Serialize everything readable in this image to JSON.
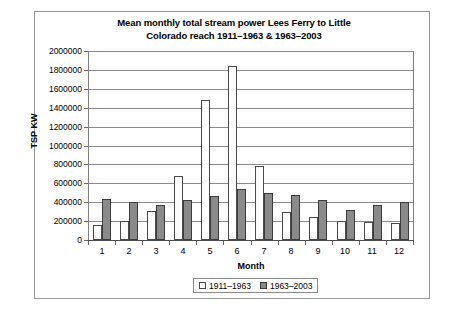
{
  "chart_data": {
    "type": "bar",
    "title": "Mean monthly total stream power Lees Ferry to Little Colorado reach 1911–1963 & 1963–2003",
    "title_line1": "Mean monthly total stream power Lees Ferry to Little",
    "title_line2": "Colorado reach 1911–1963 & 1963–2003",
    "xlabel": "Month",
    "ylabel": "TSP KW",
    "ylim": [
      0,
      2000000
    ],
    "ytick_step": 200000,
    "grid": true,
    "legend_position": "bottom-center",
    "categories": [
      "1",
      "2",
      "3",
      "4",
      "5",
      "6",
      "7",
      "8",
      "9",
      "10",
      "11",
      "12"
    ],
    "ytick_labels": [
      "2000000",
      "1800000",
      "1600000",
      "1400000",
      "1200000",
      "1000000",
      "800000",
      "600000",
      "400000",
      "200000",
      "0"
    ],
    "ytick_values": [
      2000000,
      1800000,
      1600000,
      1400000,
      1200000,
      1000000,
      800000,
      600000,
      400000,
      200000,
      0
    ],
    "series": [
      {
        "name": "1911–1963",
        "color": "#ffffff",
        "values": [
          160000,
          200000,
          310000,
          680000,
          1480000,
          1840000,
          780000,
          300000,
          240000,
          200000,
          190000,
          180000
        ]
      },
      {
        "name": "1963–2003",
        "color": "#8a8a8a",
        "values": [
          430000,
          400000,
          370000,
          420000,
          470000,
          540000,
          500000,
          480000,
          420000,
          320000,
          370000,
          400000
        ]
      }
    ]
  }
}
